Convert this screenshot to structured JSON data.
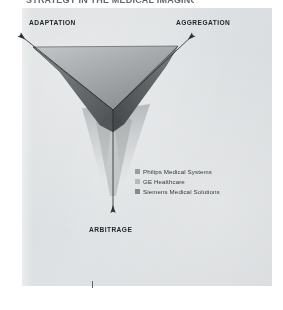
{
  "page": {
    "background_color": "#ffffff",
    "panel_color": "#dfe2e4",
    "title_fragment": "STRATEGY IN THE MEDICAL IMAGING"
  },
  "diagram": {
    "type": "triangle-framework",
    "center": {
      "x": 113,
      "y": 110
    },
    "axes": [
      {
        "id": "adaptation",
        "label": "ADAPTATION",
        "direction": "upper-left",
        "tip": {
          "x": 18,
          "y": 33
        }
      },
      {
        "id": "aggregation",
        "label": "AGGREGATION",
        "direction": "upper-right",
        "tip": {
          "x": 195,
          "y": 33
        }
      },
      {
        "id": "arbitrage",
        "label": "ARBITRAGE",
        "direction": "down",
        "tip": {
          "x": 113,
          "y": 214
        }
      }
    ],
    "faces": [
      {
        "id": "face-top",
        "fill_from": "#b9bcbe",
        "fill_to": "#8d9092"
      },
      {
        "id": "face-left",
        "fill_from": "#7e8183",
        "fill_to": "#5a5d5f"
      },
      {
        "id": "face-right",
        "fill_from": "#6e7173",
        "fill_to": "#4e5153"
      }
    ],
    "shadow": {
      "id": "face-shadow",
      "color": "#b0b4b6",
      "opacity": 0.55
    }
  },
  "legend": {
    "items": [
      {
        "label": "Philips Medical Systems",
        "color": "#9a9d9f"
      },
      {
        "label": "GE Healthcare",
        "color": "#b6b9bb"
      },
      {
        "label": "Siemens Medical Solutions",
        "color": "#878a8c"
      }
    ]
  },
  "marks": {
    "bottom_tick": "|"
  }
}
